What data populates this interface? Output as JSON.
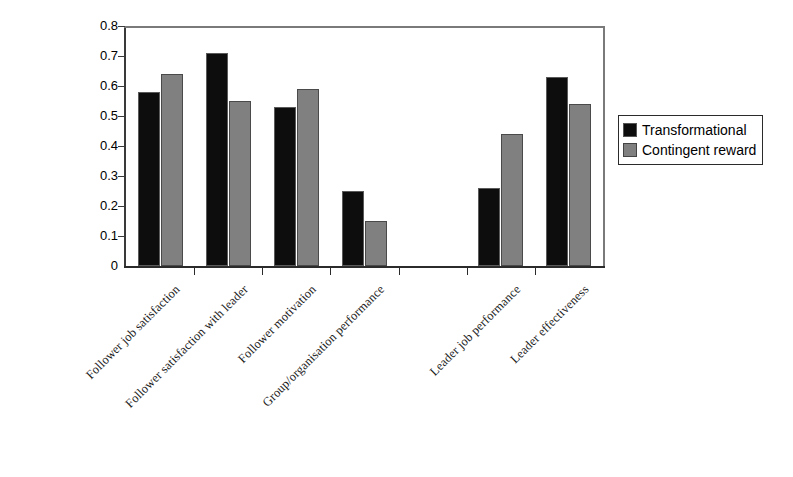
{
  "chart_data": {
    "type": "bar",
    "title": "",
    "subtitle": "",
    "xlabel": "",
    "ylabel": "",
    "ylim": [
      0,
      0.8
    ],
    "ytick_values": [
      0,
      0.1,
      0.2,
      0.3,
      0.4,
      0.5,
      0.6,
      0.7,
      0.8
    ],
    "ytick_labels": [
      "0",
      "0.1",
      "0.2",
      "0.3",
      "0.4",
      "0.5",
      "0.6",
      "0.7",
      "0.8"
    ],
    "grid": false,
    "legend_position": "right",
    "categories": [
      "Follower job satisfaction",
      "Follower satisfaction with leader",
      "Follower motivation",
      "Group/organisation performance",
      "",
      "Leader job performance",
      "Leader effectiveness"
    ],
    "series": [
      {
        "name": "Transformational",
        "color": "#0d0d0d",
        "values": [
          0.58,
          0.71,
          0.53,
          0.25,
          null,
          0.26,
          0.63
        ]
      },
      {
        "name": "Contingent reward",
        "color": "#808080",
        "values": [
          0.64,
          0.55,
          0.59,
          0.15,
          null,
          0.44,
          0.54
        ]
      }
    ]
  },
  "legend": {
    "items": [
      {
        "label": "Transformational"
      },
      {
        "label": "Contingent reward"
      }
    ]
  }
}
